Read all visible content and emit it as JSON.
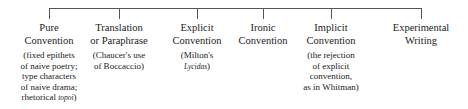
{
  "diagram": {
    "line_color": "#555555",
    "nodes": [
      {
        "title_lines": [
          "Pure",
          "Convention"
        ],
        "note_lines": [
          "(fixed epithets",
          "of naive poetry;",
          "type characters",
          "of naive drama;",
          "rhetorical "
        ],
        "note_italic": "topoi",
        "note_tail": ")",
        "x": 49
      },
      {
        "title_lines": [
          "Translation",
          "or Paraphrase"
        ],
        "note_lines": [
          "(Chaucer's use",
          "of Boccaccio)"
        ],
        "x": 119
      },
      {
        "title_lines": [
          "Explicit",
          "Convention"
        ],
        "note_lines": [
          "(Milton's"
        ],
        "note_italic": "Lycidas",
        "note_tail": ")",
        "x": 197
      },
      {
        "title_lines": [
          "Ironic",
          "Convention"
        ],
        "note_lines": [],
        "x": 263
      },
      {
        "title_lines": [
          "Implicit",
          "Convention"
        ],
        "note_lines": [
          "(the rejection",
          "of explicit",
          "convention,",
          "as in Whitman)"
        ],
        "x": 331
      },
      {
        "title_lines": [
          "Experimental",
          "Writing"
        ],
        "note_lines": [],
        "x": 421
      }
    ]
  }
}
